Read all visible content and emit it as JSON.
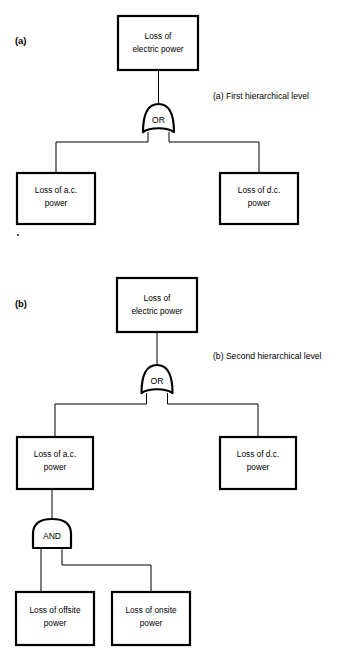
{
  "figure": {
    "background_color": "#ffffff",
    "line_color": "#000000",
    "box_fill": "#ffffff"
  },
  "panels": [
    {
      "id": "panel-a",
      "tag": "(a)",
      "caption": "(a) First hierarchical level",
      "top_event": {
        "id": "a-top",
        "line1": "Loss of",
        "line2": "electric power"
      },
      "gates": [
        {
          "id": "a-or",
          "type": "OR",
          "label": "OR"
        }
      ],
      "basic_events": [
        {
          "id": "a-ac",
          "line1": "Loss of a.c.",
          "line2": "power"
        },
        {
          "id": "a-dc",
          "line1": "Loss of d.c.",
          "line2": "power"
        }
      ]
    },
    {
      "id": "panel-b",
      "tag": "(b)",
      "caption": "(b) Second hierarchical level",
      "top_event": {
        "id": "b-top",
        "line1": "Loss of",
        "line2": "electric power"
      },
      "gates": [
        {
          "id": "b-or",
          "type": "OR",
          "label": "OR"
        },
        {
          "id": "b-and",
          "type": "AND",
          "label": "AND"
        }
      ],
      "intermediate_events": [
        {
          "id": "b-ac",
          "line1": "Loss of a.c.",
          "line2": "power"
        },
        {
          "id": "b-dc",
          "line1": "Loss of d.c.",
          "line2": "power"
        }
      ],
      "basic_events": [
        {
          "id": "b-offsite",
          "line1": "Loss of offsite",
          "line2": "power"
        },
        {
          "id": "b-onsite",
          "line1": "Loss of onsite",
          "line2": "power"
        }
      ]
    }
  ]
}
